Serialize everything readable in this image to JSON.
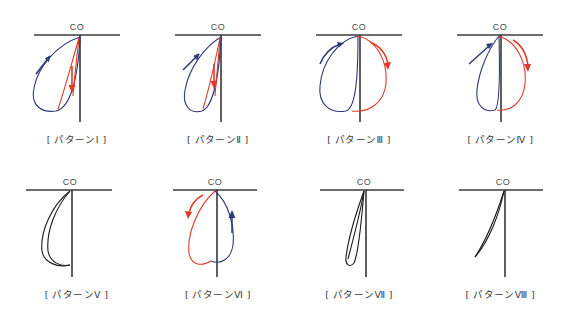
{
  "figure": {
    "title": "",
    "background_color": "#ffffff",
    "layout": {
      "rows": 2,
      "columns": 4
    },
    "colors": {
      "blue": "#2f3a78",
      "red": "#e0392c",
      "black": "#1a1a1a",
      "axis": "#3c3c3c",
      "label_text": "#3a3a3a"
    },
    "axis_label": "CO",
    "panels": [
      {
        "id": "pattern-1",
        "label": "[ パターンⅠ ]",
        "axis_label": "CO",
        "description": "narrow counter-clockwise loop, blue outer ascending limb with up-left arrow, red inner descending limb with down arrow",
        "curves": [
          {
            "color_name": "blue",
            "direction": "counter-clockwise",
            "arrow": "up-left"
          },
          {
            "color_name": "red",
            "direction": "descending",
            "arrow": "down"
          }
        ]
      },
      {
        "id": "pattern-2",
        "label": "[ パターンⅡ ]",
        "axis_label": "CO",
        "description": "narrow counter-clockwise loop, slimmer than pattern I, blue ascending limb with up-left arrow, red descending limb with down arrow",
        "curves": [
          {
            "color_name": "blue",
            "direction": "counter-clockwise",
            "arrow": "up-left"
          },
          {
            "color_name": "red",
            "direction": "descending",
            "arrow": "down"
          }
        ]
      },
      {
        "id": "pattern-3",
        "label": "[ パターンⅢ ]",
        "axis_label": "CO",
        "description": "wide open loop, blue limb left of axis with up-left arrow, red limb right of axis with down-right arrow",
        "curves": [
          {
            "color_name": "blue",
            "direction": "counter-clockwise",
            "arrow": "up-left"
          },
          {
            "color_name": "red",
            "direction": "clockwise",
            "arrow": "down-right"
          }
        ]
      },
      {
        "id": "pattern-4",
        "label": "[ パターンⅣ ]",
        "axis_label": "CO",
        "description": "narrow blue loop left of axis with up-right arrow, wide red loop right of axis with down arrow",
        "curves": [
          {
            "color_name": "blue",
            "direction": "counter-clockwise",
            "arrow": "up-right"
          },
          {
            "color_name": "red",
            "direction": "clockwise",
            "arrow": "down-right"
          }
        ]
      },
      {
        "id": "pattern-5",
        "label": "[ パターンⅤ ]",
        "axis_label": "CO",
        "description": "thin black crescent loop left of axis, no arrows",
        "curves": [
          {
            "color_name": "black",
            "direction": "none",
            "arrow": "none"
          }
        ]
      },
      {
        "id": "pattern-6",
        "label": "[ パターンⅥ ]",
        "axis_label": "CO",
        "description": "tilted clockwise loop, red limb on the left with down-left arrow, blue limb on the right with up arrow",
        "curves": [
          {
            "color_name": "red",
            "direction": "clockwise",
            "arrow": "down-left"
          },
          {
            "color_name": "blue",
            "direction": "clockwise",
            "arrow": "up"
          }
        ]
      },
      {
        "id": "pattern-7",
        "label": "[ パターンⅦ ]",
        "axis_label": "CO",
        "description": "thin black crossed figure-eight loop near the axis, no arrows",
        "curves": [
          {
            "color_name": "black",
            "direction": "none",
            "arrow": "none"
          }
        ]
      },
      {
        "id": "pattern-8",
        "label": "[ パターンⅧ ]",
        "axis_label": "CO",
        "description": "very thin black sliver curve sloping down-left from the axis, no arrows",
        "curves": [
          {
            "color_name": "black",
            "direction": "none",
            "arrow": "none"
          }
        ]
      }
    ]
  }
}
